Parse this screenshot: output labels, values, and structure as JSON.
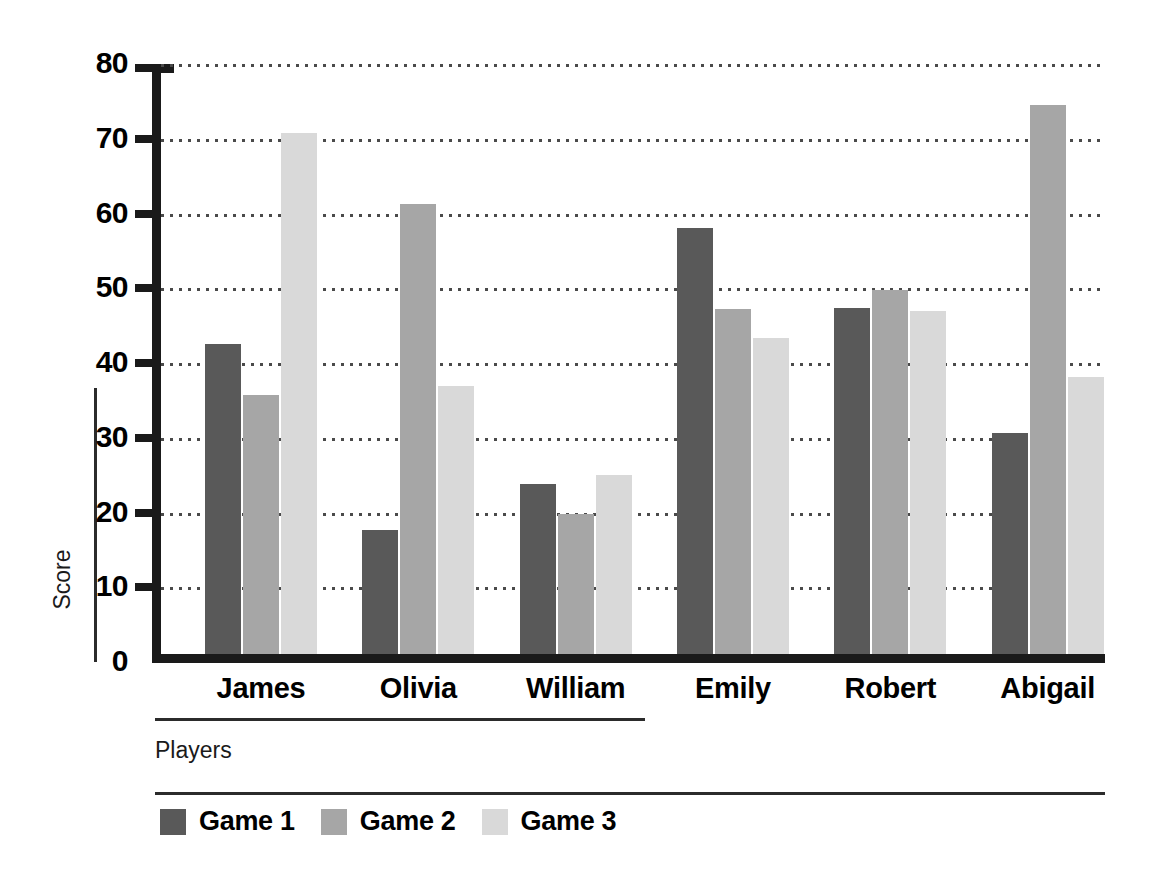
{
  "chart_data": {
    "type": "bar",
    "title": "",
    "xlabel": "Players",
    "ylabel": "Score",
    "categories": [
      "James",
      "Olivia",
      "William",
      "Emily",
      "Robert",
      "Abigail"
    ],
    "series": [
      {
        "name": "Game 1",
        "color": "#595959",
        "values": [
          42.5,
          17.7,
          23.8,
          58.0,
          47.3,
          30.7
        ]
      },
      {
        "name": "Game 2",
        "color": "#a6a6a6",
        "values": [
          35.7,
          61.3,
          19.8,
          47.2,
          49.8,
          74.5
        ]
      },
      {
        "name": "Game 3",
        "color": "#d9d9d9",
        "values": [
          70.8,
          36.9,
          25.0,
          43.3,
          46.9,
          38.1
        ]
      }
    ],
    "ylim": [
      0,
      80
    ],
    "yticks": [
      0,
      10,
      20,
      30,
      40,
      50,
      60,
      70,
      80
    ],
    "ytick_labels": [
      "0",
      "10",
      "20",
      "30",
      "40",
      "50",
      "60",
      "70",
      "80"
    ],
    "grid": true,
    "grid_axis": "y",
    "grid_style": "dotted",
    "legend_position": "bottom-left",
    "orientation": "vertical",
    "grouping": "grouped",
    "background": "#ffffff",
    "axis_color": "#1a1a1a"
  }
}
